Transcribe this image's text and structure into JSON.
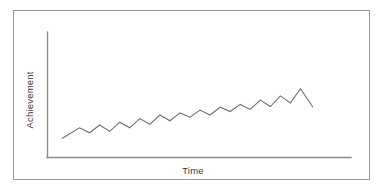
{
  "figure": {
    "background_color": "#ffffff",
    "frame_color": "#9a9a9a",
    "axis_color": "#8c8c8c"
  },
  "chart_data": {
    "type": "line",
    "title": "",
    "subtitle": "",
    "xlabel": "Time",
    "ylabel": "Achievement",
    "grid": false,
    "legend": false,
    "legend_position": "none",
    "line_color": "#6e6e6e",
    "xlim": [
      0,
      100
    ],
    "ylim": [
      0,
      100
    ],
    "x_tick_labels": [],
    "y_tick_labels": [],
    "annotations": [],
    "series": [
      {
        "name": "Achievement",
        "x": [
          0,
          7,
          11,
          15,
          19,
          23,
          27,
          31,
          35,
          39,
          43,
          47,
          51,
          55,
          59,
          63,
          67,
          71,
          75,
          79,
          83,
          87,
          91,
          95,
          100
        ],
        "values": [
          12,
          27,
          20,
          31,
          22,
          35,
          27,
          40,
          32,
          45,
          37,
          48,
          42,
          52,
          45,
          56,
          50,
          60,
          53,
          66,
          57,
          72,
          62,
          82,
          56
        ]
      }
    ]
  }
}
